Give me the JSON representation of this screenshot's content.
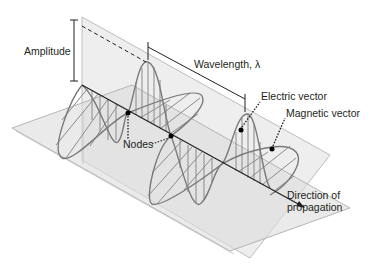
{
  "diagram": {
    "labels": {
      "amplitude": "Amplitude",
      "wavelength": "Wavelength, λ",
      "electric_vector": "Electric vector",
      "magnetic_vector": "Magnetic vector",
      "nodes": "Nodes",
      "direction_line1": "Direction of",
      "direction_line2": "propagation"
    },
    "colors": {
      "plane_fill": "#e6e6e6",
      "plane_edge": "#b8b8b8",
      "wave_line": "#7a7a7a",
      "axis_line": "#231f20",
      "text": "#231f20"
    }
  }
}
